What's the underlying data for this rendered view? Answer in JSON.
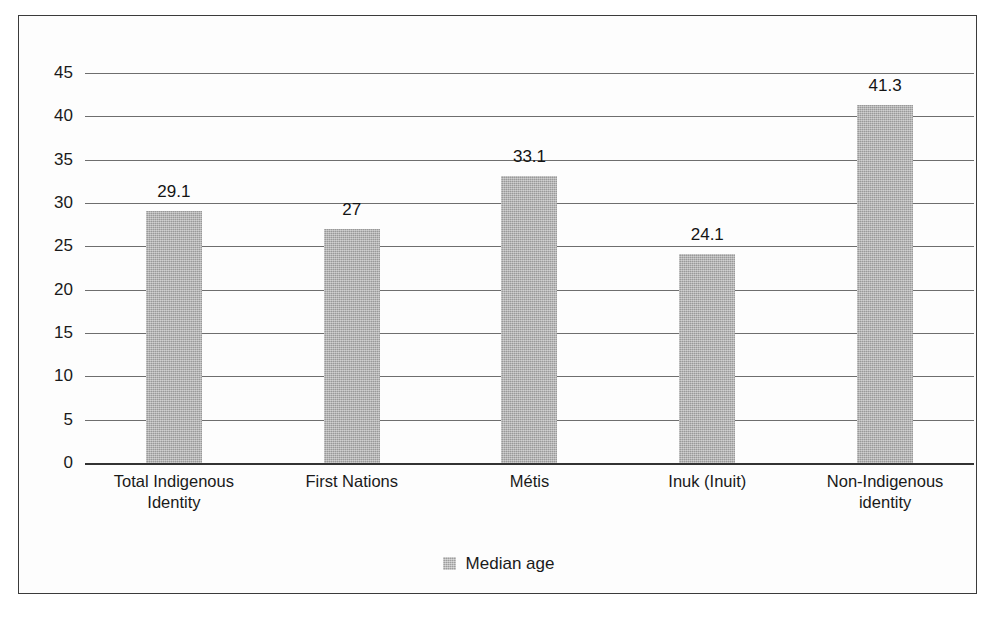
{
  "chart_data": {
    "type": "bar",
    "title": "",
    "subtitle": "",
    "xlabel": "",
    "ylabel": "",
    "categories": [
      "Total Indigenous Identity",
      "First Nations",
      "Métis",
      "Inuk (Inuit)",
      "Non-Indigenous identity"
    ],
    "category_lines": [
      [
        "Total Indigenous",
        "Identity"
      ],
      [
        "First Nations"
      ],
      [
        "Métis"
      ],
      [
        "Inuk (Inuit)"
      ],
      [
        "Non-Indigenous",
        "identity"
      ]
    ],
    "series": [
      {
        "name": "Median age",
        "values": [
          29.1,
          27,
          33.1,
          24.1,
          41.3
        ],
        "value_labels": [
          "29.1",
          "27",
          "33.1",
          "24.1",
          "41.3"
        ],
        "color": "#a9a9a9"
      }
    ],
    "ylim": [
      0,
      45
    ],
    "ytick_values": [
      0,
      5,
      10,
      15,
      20,
      25,
      30,
      35,
      40,
      45
    ],
    "ytick_labels": [
      "0",
      "5",
      "10",
      "15",
      "20",
      "25",
      "30",
      "35",
      "40",
      "45"
    ],
    "grid": true,
    "grid_axis": "y",
    "legend": {
      "position": "bottom",
      "entries": [
        {
          "label": "Median age",
          "color": "#a9a9a9"
        }
      ]
    },
    "frame": {
      "border_color": "#3b3b3b",
      "background": "#fdfdfd"
    }
  }
}
